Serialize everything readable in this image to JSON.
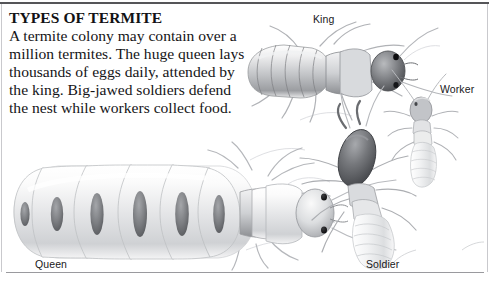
{
  "panel": {
    "headline": "TYPES OF TERMITE",
    "body": "A termite colony may contain over a million termites. The huge queen lays thousands of eggs daily, attended by the king. Big-jawed soldiers defend the nest while workers collect food."
  },
  "captions": {
    "king": "King",
    "worker": "Worker",
    "queen": "Queen",
    "soldier": "Soldier"
  },
  "colors": {
    "rule_top": "#555558",
    "rule_bottom": "#9a9a9e",
    "rule_side": "#c9c9cd",
    "text": "#151517",
    "headline": "#121214",
    "background": "#ffffff",
    "termite_body_light": "#e6e7e9",
    "termite_body_mid": "#b2b4b8",
    "termite_body_dark": "#6e7074",
    "termite_head_dark": "#5c5e62",
    "sketch_line": "#b9bbbf"
  }
}
